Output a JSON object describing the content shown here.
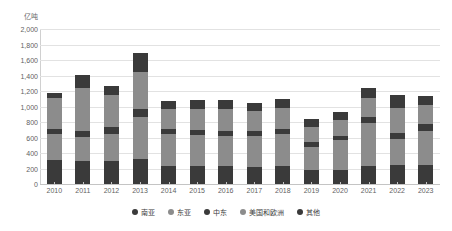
{
  "chart_data": {
    "type": "bar",
    "stacked": true,
    "title": "",
    "subtitle": "",
    "xlabel": "",
    "ylabel": "亿吨",
    "unit_label": "亿吨",
    "ylim": [
      0,
      2000
    ],
    "ytick_step": 200,
    "grid": true,
    "legend_position": "bottom",
    "ytick_labels": [
      "2,000",
      "1,800",
      "1,600",
      "1,400",
      "1,200",
      "1,000",
      "800",
      "600",
      "400",
      "200",
      "0"
    ],
    "ytick_values": [
      2000,
      1800,
      1600,
      1400,
      1200,
      1000,
      800,
      600,
      400,
      200,
      0
    ],
    "categories": [
      "2010",
      "2011",
      "2012",
      "2013",
      "2014",
      "2015",
      "2016",
      "2017",
      "2018",
      "2019",
      "2020",
      "2021",
      "2022",
      "2023"
    ],
    "series": [
      {
        "name": "南亚",
        "color": "#3a3a3a",
        "values": [
          310,
          300,
          300,
          320,
          230,
          230,
          230,
          215,
          230,
          175,
          175,
          235,
          250,
          250
        ]
      },
      {
        "name": "东亚",
        "color": "#8c8c8c",
        "values": [
          330,
          310,
          350,
          540,
          410,
          400,
          390,
          400,
          415,
          300,
          390,
          555,
          330,
          440
        ]
      },
      {
        "name": "中东",
        "color": "#3a3a3a",
        "values": [
          70,
          70,
          90,
          110,
          70,
          70,
          70,
          70,
          70,
          65,
          55,
          70,
          75,
          80
        ]
      },
      {
        "name": "美国和欧洲",
        "color": "#8c8c8c",
        "values": [
          400,
          560,
          410,
          480,
          260,
          270,
          280,
          260,
          270,
          195,
          210,
          250,
          330,
          255
        ]
      },
      {
        "name": "其他",
        "color": "#3a3a3a",
        "values": [
          60,
          165,
          110,
          235,
          105,
          110,
          110,
          105,
          110,
          110,
          105,
          135,
          160,
          115
        ]
      }
    ]
  }
}
